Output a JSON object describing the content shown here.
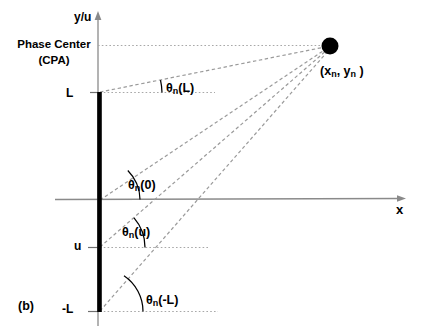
{
  "figure": {
    "subfigure_label": "(b)",
    "axes": {
      "y_label": "y/u",
      "x_label": "x",
      "origin": {
        "x": 98,
        "y": 200
      }
    },
    "annotations": {
      "phase_center_line1": "Phase Center",
      "phase_center_line2": "(CPA)",
      "point_label_open": "(x",
      "point_sub_1": "n",
      "point_label_mid": ", y",
      "point_sub_2": "n",
      "point_label_close": " )"
    },
    "ticks": [
      {
        "name": "upper-end",
        "label": "L",
        "y": 92
      },
      {
        "name": "element-u",
        "label": "u",
        "y": 247
      },
      {
        "name": "lower-end",
        "label": "-L",
        "y": 312
      }
    ],
    "angles": [
      {
        "name": "theta-L",
        "theta": "θ",
        "sub": "n",
        "arg": "(L)",
        "vertex_y": 92,
        "label_x": 166,
        "label_y": 81
      },
      {
        "name": "theta-0",
        "theta": "θ",
        "sub": "n",
        "arg": "(0)",
        "vertex_y": 200,
        "label_x": 128,
        "label_y": 178
      },
      {
        "name": "theta-u",
        "theta": "θ",
        "sub": "n",
        "arg": "(u)",
        "vertex_y": 247,
        "label_x": 122,
        "label_y": 225
      },
      {
        "name": "theta-negL",
        "theta": "θ",
        "sub": "n",
        "arg": "(-L)",
        "vertex_y": 312,
        "label_x": 146,
        "label_y": 293
      }
    ],
    "source_point": {
      "x": 330,
      "y": 46,
      "radius": 8.5
    },
    "aperture_bar": {
      "x": 98,
      "y_top": 92,
      "y_bottom": 312,
      "width": 4.5
    },
    "colors": {
      "ink": "#000000",
      "axis": "#8a8a8a",
      "dashed_ray": "#9a9a9a",
      "dotted_guide": "#b0b0b0",
      "arc": "#000000",
      "background": "#ffffff"
    }
  }
}
